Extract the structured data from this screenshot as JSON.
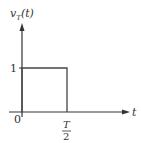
{
  "diagram": {
    "type": "rectangular-pulse-plot",
    "y_axis_label": {
      "main": "v",
      "sub": "T",
      "arg": "(t)"
    },
    "x_axis_label": "t",
    "y_tick_label": "1",
    "origin_label": "0",
    "x_tick_label": {
      "numerator": "T",
      "denominator": "2"
    },
    "pulse": {
      "amplitude": 1,
      "start": 0,
      "end": "T/2"
    },
    "colors": {
      "axis": "#333333",
      "pulse": "#444444",
      "background": "#ffffff"
    }
  }
}
